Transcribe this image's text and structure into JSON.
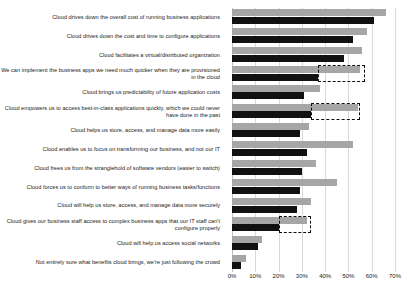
{
  "chart_data": {
    "type": "bar",
    "orientation": "horizontal",
    "title": "",
    "subtitle": "",
    "xlabel": "",
    "ylabel": "",
    "xlim": [
      0,
      70
    ],
    "grid": true,
    "legend_position": "none",
    "tick_labels": [
      "0%",
      "10%",
      "20%",
      "30%",
      "40%",
      "50%",
      "60%",
      "70%"
    ],
    "tick_values": [
      0,
      10,
      20,
      30,
      40,
      50,
      60,
      70
    ],
    "colors": {
      "series_0": "#a6a6a6",
      "series_1": "#111111",
      "grid": "#d9d9d9",
      "annotation": "#0d0d0d"
    },
    "categories": [
      "Cloud drives down the overall cost of running business applications",
      "Cloud drives down the cost and time to configure applications",
      "Cloud facilitates a virtual/distributed organization",
      "We can implement the business apps we need much quicker when they are provisioned in the cloud",
      "Cloud brings us predictability of future application costs",
      "Cloud empowers us to access best-in-class applications quickly, which we could never have done in the past",
      "Cloud helps us store, access, and manage data more easily",
      "Cloud enables us to focus on transforming our business, and not our IT",
      "Cloud frees us from the stranglehold of software vendors (easier to switch)",
      "Cloud forces us to conform to better ways of running business tasks/functions",
      "Cloud will help us store, access, and manage data more securely",
      "Cloud gives our business staff access to complex business apps that our IT staff can't configure properly",
      "Cloud will help us access social networks",
      "Not entirely sure what benefits cloud brings, we're just following the crowd"
    ],
    "series": [
      {
        "name": "Series 1",
        "color": "#a6a6a6",
        "values": [
          66,
          58,
          56,
          55,
          38,
          54,
          33,
          52,
          36,
          45,
          34,
          32,
          13,
          6
        ]
      },
      {
        "name": "Series 2",
        "color": "#111111",
        "values": [
          61,
          52,
          48,
          37,
          31,
          34,
          29,
          32,
          30,
          29,
          28,
          20,
          11,
          4
        ]
      }
    ],
    "annotations": [
      {
        "type": "dashed-box",
        "category_index": 3,
        "from": 37,
        "to": 57,
        "note": "highlight"
      },
      {
        "type": "dashed-box",
        "category_index": 5,
        "from": 34,
        "to": 55,
        "note": "highlight"
      },
      {
        "type": "dashed-box",
        "category_index": 11,
        "from": 20,
        "to": 34,
        "note": "highlight"
      }
    ]
  }
}
